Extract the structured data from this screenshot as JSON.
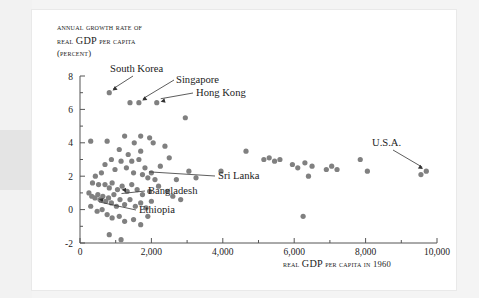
{
  "figure": {
    "background_color": "#ffffff",
    "dot_color": "#808080",
    "axis_color": "#555555",
    "text_color": "#1c1c1c"
  },
  "axis_labels": {
    "y_line1": "Annual growth rate of",
    "y_line2_a": "real ",
    "y_line2_b": "GDP",
    "y_line2_c": " per capita",
    "y_line3": "(percent)",
    "x_title_a": "Real ",
    "x_title_b": "GDP",
    "x_title_c": " per capita in 1960"
  },
  "chart_data": {
    "type": "scatter",
    "title": "",
    "xlabel": "Real GDP per capita in 1960",
    "ylabel": "Annual growth rate of real GDP per capita (percent)",
    "xlim": [
      0,
      10000
    ],
    "ylim": [
      -2,
      8
    ],
    "xticks": [
      0,
      2000,
      4000,
      6000,
      8000,
      10000
    ],
    "xtick_labels": [
      "0",
      "2,000",
      "4,000",
      "6,000",
      "8,000",
      "10,000"
    ],
    "xminor_ticks": [
      1000,
      3000,
      5000,
      7000,
      9000
    ],
    "yticks": [
      -2,
      0,
      2,
      4,
      6,
      8
    ],
    "ytick_labels": [
      "-2",
      "0",
      "2",
      "4",
      "6",
      "8"
    ],
    "yminor_ticks": [
      -1,
      1,
      3,
      5,
      7
    ],
    "grid": false,
    "legend": false,
    "points": [
      [
        820,
        7.0
      ],
      [
        1400,
        6.4
      ],
      [
        1650,
        6.4
      ],
      [
        2150,
        6.4
      ],
      [
        2950,
        5.5
      ],
      [
        300,
        4.1
      ],
      [
        760,
        4.1
      ],
      [
        1250,
        4.4
      ],
      [
        1520,
        4.0
      ],
      [
        1700,
        4.4
      ],
      [
        1950,
        4.3
      ],
      [
        2050,
        4.0
      ],
      [
        1100,
        3.6
      ],
      [
        1350,
        3.3
      ],
      [
        1700,
        3.5
      ],
      [
        2380,
        3.8
      ],
      [
        2500,
        3.1
      ],
      [
        2250,
        2.6
      ],
      [
        1650,
        3.0
      ],
      [
        1450,
        2.9
      ],
      [
        1150,
        2.9
      ],
      [
        880,
        3.0
      ],
      [
        700,
        2.7
      ],
      [
        980,
        2.4
      ],
      [
        1300,
        2.5
      ],
      [
        1500,
        2.2
      ],
      [
        1750,
        2.1
      ],
      [
        1820,
        2.5
      ],
      [
        1900,
        1.9
      ],
      [
        2000,
        2.2
      ],
      [
        2100,
        1.8
      ],
      [
        600,
        2.2
      ],
      [
        430,
        2.0
      ],
      [
        350,
        1.6
      ],
      [
        520,
        1.5
      ],
      [
        700,
        1.5
      ],
      [
        820,
        1.3
      ],
      [
        900,
        1.6
      ],
      [
        1050,
        1.2
      ],
      [
        1180,
        1.4
      ],
      [
        1320,
        1.1
      ],
      [
        1450,
        1.5
      ],
      [
        1600,
        1.2
      ],
      [
        1750,
        0.9
      ],
      [
        1950,
        1.1
      ],
      [
        2200,
        1.4
      ],
      [
        2450,
        1.1
      ],
      [
        2600,
        0.8
      ],
      [
        250,
        1.0
      ],
      [
        330,
        0.8
      ],
      [
        420,
        0.7
      ],
      [
        500,
        0.9
      ],
      [
        560,
        0.6
      ],
      [
        640,
        0.8
      ],
      [
        720,
        0.5
      ],
      [
        800,
        0.7
      ],
      [
        880,
        0.4
      ],
      [
        950,
        0.9
      ],
      [
        1020,
        0.2
      ],
      [
        1120,
        0.6
      ],
      [
        1250,
        0.3
      ],
      [
        1400,
        0.6
      ],
      [
        1550,
        0.2
      ],
      [
        1700,
        0.4
      ],
      [
        1850,
        0.1
      ],
      [
        2000,
        0.5
      ],
      [
        300,
        0.2
      ],
      [
        480,
        -0.1
      ],
      [
        620,
        0.0
      ],
      [
        760,
        -0.3
      ],
      [
        900,
        -0.5
      ],
      [
        1100,
        -0.4
      ],
      [
        1250,
        -0.7
      ],
      [
        1500,
        -0.6
      ],
      [
        1700,
        -0.9
      ],
      [
        1900,
        -0.4
      ],
      [
        820,
        -1.5
      ],
      [
        1150,
        -1.8
      ],
      [
        2700,
        1.8
      ],
      [
        2820,
        0.6
      ],
      [
        3050,
        2.3
      ],
      [
        3250,
        1.9
      ],
      [
        3950,
        2.3
      ],
      [
        4650,
        3.5
      ],
      [
        5150,
        3.0
      ],
      [
        5300,
        3.1
      ],
      [
        5450,
        2.9
      ],
      [
        5600,
        3.0
      ],
      [
        5950,
        2.7
      ],
      [
        6100,
        2.5
      ],
      [
        6300,
        2.8
      ],
      [
        6500,
        2.6
      ],
      [
        6400,
        2.0
      ],
      [
        6250,
        -0.4
      ],
      [
        6900,
        2.4
      ],
      [
        7050,
        2.6
      ],
      [
        7200,
        2.4
      ],
      [
        7850,
        3.0
      ],
      [
        8050,
        2.3
      ],
      [
        9550,
        2.1
      ],
      [
        9700,
        2.3
      ]
    ],
    "annotations": [
      {
        "label": "South Korea",
        "point": [
          820,
          7.0
        ]
      },
      {
        "label": "Singapore",
        "point": [
          1650,
          6.4
        ]
      },
      {
        "label": "Hong Kong",
        "point": [
          2150,
          6.4
        ]
      },
      {
        "label": "Sri Lanka",
        "point": [
          1820,
          2.5
        ]
      },
      {
        "label": "Bangladesh",
        "point": [
          1050,
          1.2
        ]
      },
      {
        "label": "Ethiopia",
        "point": [
          420,
          0.7
        ]
      },
      {
        "label": "U.S.A.",
        "point": [
          9700,
          2.3
        ]
      }
    ]
  }
}
